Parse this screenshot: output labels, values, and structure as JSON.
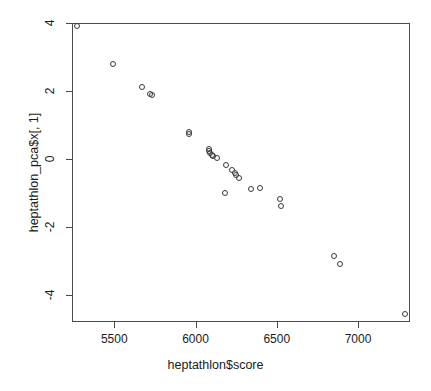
{
  "chart_data": {
    "type": "scatter",
    "title": "",
    "xlabel": "heptathlon$score",
    "ylabel": "heptathlon_pca$x[, 1]",
    "xlim": [
      5240,
      7320
    ],
    "ylim": [
      -4.8,
      4.0
    ],
    "xticks": [
      5500,
      6000,
      6500,
      7000
    ],
    "xtick_labels": [
      "5500",
      "6000",
      "6500",
      "7000"
    ],
    "yticks": [
      4,
      2,
      0,
      -2,
      -4
    ],
    "ytick_labels": [
      "4",
      "2",
      "0",
      "-2",
      "-4"
    ],
    "grid": false,
    "legend": null,
    "marker": "open-circle",
    "marker_color": "#3a3a3a",
    "n_points": 25,
    "points": [
      {
        "x": 5270,
        "y": 3.9
      },
      {
        "x": 5490,
        "y": 2.78
      },
      {
        "x": 5670,
        "y": 2.13
      },
      {
        "x": 5720,
        "y": 1.92
      },
      {
        "x": 5730,
        "y": 1.87
      },
      {
        "x": 5960,
        "y": 0.8
      },
      {
        "x": 5960,
        "y": 0.72
      },
      {
        "x": 6080,
        "y": 0.28
      },
      {
        "x": 6085,
        "y": 0.22
      },
      {
        "x": 6090,
        "y": 0.18
      },
      {
        "x": 6100,
        "y": 0.12
      },
      {
        "x": 6110,
        "y": 0.08
      },
      {
        "x": 6135,
        "y": 0.03
      },
      {
        "x": 6190,
        "y": -0.18
      },
      {
        "x": 6225,
        "y": -0.32
      },
      {
        "x": 6245,
        "y": -0.4
      },
      {
        "x": 6250,
        "y": -0.48
      },
      {
        "x": 6270,
        "y": -0.55
      },
      {
        "x": 6180,
        "y": -1.01
      },
      {
        "x": 6340,
        "y": -0.88
      },
      {
        "x": 6395,
        "y": -0.87
      },
      {
        "x": 6520,
        "y": -1.19
      },
      {
        "x": 6525,
        "y": -1.4
      },
      {
        "x": 6850,
        "y": -2.85
      },
      {
        "x": 6890,
        "y": -3.08
      },
      {
        "x": 7290,
        "y": -4.55
      }
    ]
  },
  "axes": {
    "x_title": "heptathlon$score",
    "y_title": "heptathlon_pca$x[, 1]"
  }
}
